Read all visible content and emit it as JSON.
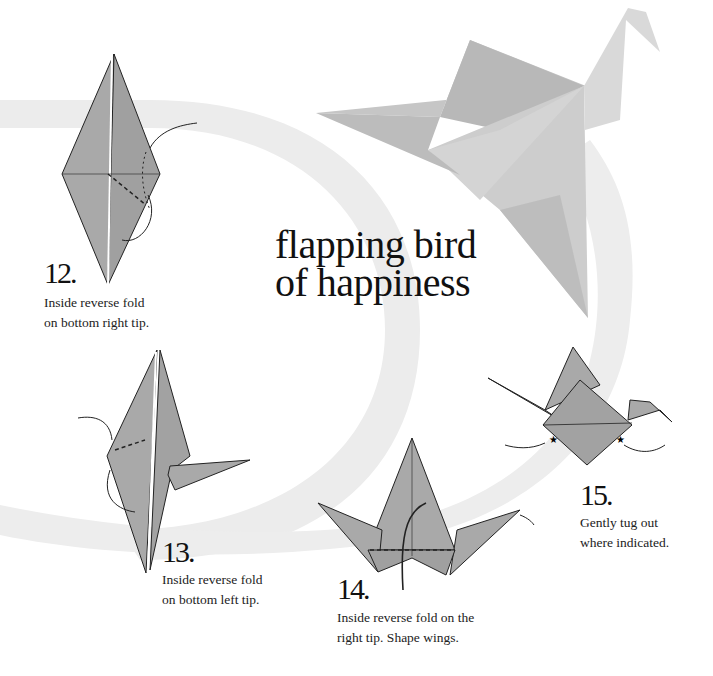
{
  "title": {
    "line1": "flapping bird",
    "line2": "of happiness"
  },
  "colors": {
    "paper": "#a9a9a9",
    "paper_dark": "#9a9a9a",
    "swoosh": "#ececec",
    "crane_photo": "#c4c4c4",
    "text": "#111111"
  },
  "steps": [
    {
      "number": "12.",
      "line1": "Inside reverse fold",
      "line2": "on bottom right tip."
    },
    {
      "number": "13.",
      "line1": "Inside reverse fold",
      "line2": "on bottom left tip."
    },
    {
      "number": "14.",
      "line1": "Inside reverse fold on the",
      "line2": "right tip. Shape wings."
    },
    {
      "number": "15.",
      "line1": "Gently tug out",
      "line2": "where indicated."
    }
  ],
  "icons": {
    "hero": "origami-crane-photo",
    "arrow": "fold-arrow-icon",
    "star": "tug-star-icon"
  }
}
